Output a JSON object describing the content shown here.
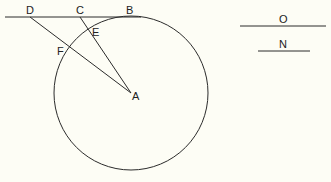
{
  "diagram": {
    "points": {
      "A": "A",
      "B": "B",
      "C": "C",
      "D": "D",
      "E": "E",
      "F": "F"
    },
    "legend": {
      "top_label": "O",
      "bottom_label": "N"
    },
    "colors": {
      "background": "#fdfdf5",
      "stroke": "#2b2b2b"
    }
  }
}
